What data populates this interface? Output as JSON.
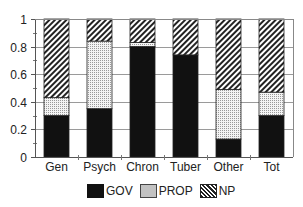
{
  "chart_data": {
    "type": "bar",
    "stacked": true,
    "title": "",
    "xlabel": "",
    "ylabel": "",
    "ylim": [
      0,
      1
    ],
    "yticks": [
      "0",
      "0.2",
      "0.4",
      "0.6",
      "0.8",
      "1"
    ],
    "grid": true,
    "legend_position": "bottom",
    "categories": [
      "Gen",
      "Psych",
      "Chron",
      "Tuber",
      "Other",
      "Tot"
    ],
    "series": [
      {
        "name": "GOV",
        "values": [
          0.3,
          0.35,
          0.8,
          0.74,
          0.13,
          0.3
        ]
      },
      {
        "name": "PROP",
        "values": [
          0.13,
          0.49,
          0.03,
          0.0,
          0.36,
          0.17
        ]
      },
      {
        "name": "NP",
        "values": [
          0.57,
          0.16,
          0.17,
          0.26,
          0.51,
          0.53
        ]
      }
    ]
  },
  "legend": {
    "items": [
      {
        "label": "GOV",
        "pattern": "solid-black"
      },
      {
        "label": "PROP",
        "pattern": "dotted"
      },
      {
        "label": "NP",
        "pattern": "diagonal-hatch"
      }
    ]
  }
}
